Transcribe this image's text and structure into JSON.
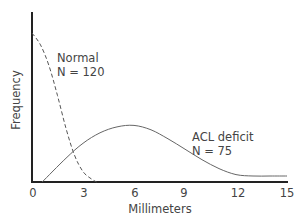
{
  "chart_data": {
    "type": "line",
    "title": "",
    "xlabel": "Millimeters",
    "ylabel": "Frequency",
    "xlim": [
      0,
      15
    ],
    "ylim": [
      0,
      1
    ],
    "x_ticks": [
      "0",
      "3",
      "6",
      "9",
      "12",
      "15"
    ],
    "y_ticks": [],
    "grid": false,
    "legend": "inline annotations",
    "series": [
      {
        "name": "Normal",
        "n_label": "N = 120",
        "style": "dashed",
        "x": [
          0,
          0.5,
          1,
          1.5,
          2,
          2.5,
          3,
          3.5,
          3.8
        ],
        "y": [
          1.0,
          0.92,
          0.78,
          0.58,
          0.36,
          0.18,
          0.07,
          0.02,
          0.0
        ]
      },
      {
        "name": "ACL deficit",
        "n_label": "N = 75",
        "style": "solid",
        "x": [
          0.6,
          2,
          3,
          4,
          5,
          6,
          7,
          8,
          9,
          10,
          11,
          12,
          13,
          14,
          15
        ],
        "y": [
          0.0,
          0.16,
          0.26,
          0.33,
          0.37,
          0.38,
          0.35,
          0.29,
          0.22,
          0.15,
          0.09,
          0.05,
          0.04,
          0.04,
          0.04
        ]
      }
    ],
    "annotations": [
      {
        "text": "Normal",
        "near_series": "Normal"
      },
      {
        "text": "N = 120",
        "near_series": "Normal"
      },
      {
        "text": "ACL deficit",
        "near_series": "ACL deficit"
      },
      {
        "text": "N = 75",
        "near_series": "ACL deficit"
      }
    ]
  },
  "labels": {
    "xlabel": "Millimeters",
    "ylabel": "Frequency",
    "ticks": [
      "0",
      "3",
      "6",
      "9",
      "12",
      "15"
    ],
    "normal_name": "Normal",
    "normal_n": "N = 120",
    "acl_name": "ACL deficit",
    "acl_n": "N = 75"
  },
  "colors": {
    "axis": "#222222",
    "curve": "#555555",
    "text": "#444444"
  }
}
